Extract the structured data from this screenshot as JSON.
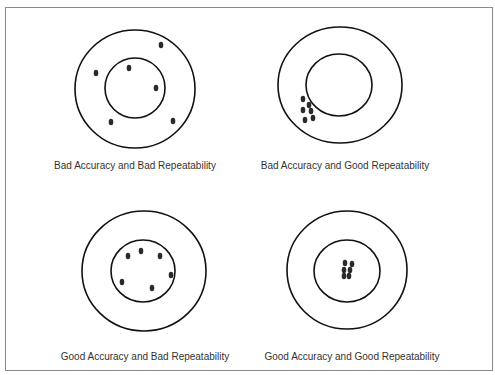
{
  "panels": [
    {
      "caption": "Bad Accuracy and Bad Repeatability",
      "caption_pos": [
        135,
        160
      ],
      "outer": {
        "cx": 135,
        "cy": 89,
        "rx": 60,
        "ry": 59
      },
      "inner": {
        "cx": 135,
        "cy": 88,
        "rx": 30,
        "ry": 30
      },
      "dots": [
        [
          161,
          45
        ],
        [
          96,
          73
        ],
        [
          129,
          68
        ],
        [
          156,
          88
        ],
        [
          111,
          122
        ],
        [
          173,
          121
        ]
      ]
    },
    {
      "caption": "Bad Accuracy and Good Repeatability",
      "caption_pos": [
        345,
        160
      ],
      "outer": {
        "cx": 340,
        "cy": 85,
        "rx": 62,
        "ry": 58
      },
      "inner": {
        "cx": 339,
        "cy": 85,
        "rx": 33,
        "ry": 31
      },
      "dots": [
        [
          303,
          99
        ],
        [
          309,
          105
        ],
        [
          303,
          110
        ],
        [
          311,
          111
        ],
        [
          305,
          120
        ],
        [
          313,
          118
        ]
      ]
    },
    {
      "caption": "Good Accuracy and Bad Repeatability",
      "caption_pos": [
        145,
        351
      ],
      "outer": {
        "cx": 144,
        "cy": 271,
        "rx": 62,
        "ry": 60
      },
      "inner": {
        "cx": 143,
        "cy": 271,
        "rx": 32,
        "ry": 31
      },
      "dots": [
        [
          128,
          256
        ],
        [
          141,
          251
        ],
        [
          160,
          256
        ],
        [
          171,
          275
        ],
        [
          122,
          282
        ],
        [
          152,
          288
        ]
      ]
    },
    {
      "caption": "Good Accuracy and Good Repeatability",
      "caption_pos": [
        352,
        351
      ],
      "outer": {
        "cx": 347,
        "cy": 270,
        "rx": 60,
        "ry": 59
      },
      "inner": {
        "cx": 347,
        "cy": 271,
        "rx": 33,
        "ry": 31
      },
      "dots": [
        [
          345,
          263
        ],
        [
          352,
          264
        ],
        [
          344,
          270
        ],
        [
          350,
          270
        ],
        [
          344,
          276
        ],
        [
          349,
          276
        ]
      ]
    }
  ],
  "colors": {
    "stroke": "#111111",
    "dot": "#2a2a2a",
    "frame": "#8a8a8a",
    "text": "#333333"
  }
}
